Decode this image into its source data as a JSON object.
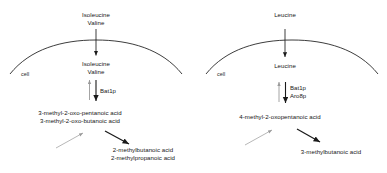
{
  "figure": {
    "type": "pathway-diagram",
    "panel_count": 2,
    "stroke_color": "#1a1a1a",
    "faint_stroke_color": "#9a9a9a",
    "text_color": "#161616",
    "background": "#ffffff"
  },
  "panels": [
    {
      "id": "branched-chain-panel",
      "extracellular_substrate": {
        "line1": "Isoleucine",
        "line2": "Valine"
      },
      "intracellular_substrate": {
        "line1": "Isoleucine",
        "line2": "Valine"
      },
      "cell_label": "cell",
      "enzymes": [
        "Bat1p"
      ],
      "keto_acids": {
        "line1": "3-methyl-2-oxo-pentanoic acid",
        "line2": "3-methyl-2-oxo-butanoic acid"
      },
      "products": {
        "line1": "2-methylbutanoic acid",
        "line2": "2-methylpropanoic acid"
      }
    },
    {
      "id": "leucine-panel",
      "extracellular_substrate": {
        "line1": "Leucine",
        "line2": ""
      },
      "intracellular_substrate": {
        "line1": "Leucine",
        "line2": ""
      },
      "cell_label": "cell",
      "enzymes": [
        "Bat1p",
        "Aro8p"
      ],
      "keto_acids": {
        "line1": "4-methyl-2-oxopentanoic acid",
        "line2": ""
      },
      "products": {
        "line1": "3-methylbutanoic acid",
        "line2": ""
      }
    }
  ]
}
